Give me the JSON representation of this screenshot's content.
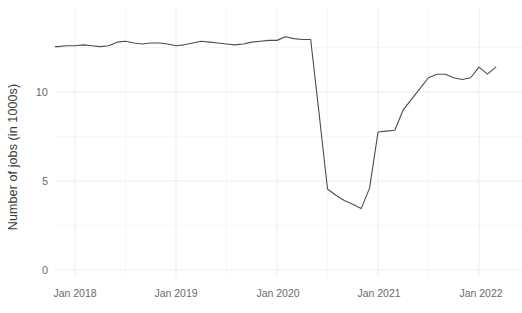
{
  "chart_data": {
    "type": "line",
    "title": "",
    "subtitle": "",
    "xlabel": "",
    "ylabel": "Number of jobs (in 1000s)",
    "ylim": [
      0,
      14
    ],
    "xlim": [
      "2017-09",
      "2022-05"
    ],
    "grid": true,
    "legend": null,
    "line_color": "#4d4d4d",
    "background": "#ffffff",
    "gridline_color": "#f4f4f4",
    "y_ticks": [
      "0",
      "5",
      "10"
    ],
    "y_tick_values": [
      0,
      5,
      10
    ],
    "x_ticks": [
      "Jan 2018",
      "Jan 2019",
      "Jan 2020",
      "Jan 2021",
      "Jan 2022"
    ],
    "x_tick_values": [
      "2018-01",
      "2019-01",
      "2020-01",
      "2021-01",
      "2022-01"
    ],
    "series": [
      {
        "name": "Number of jobs",
        "x": [
          "2017-10",
          "2017-11",
          "2017-12",
          "2018-01",
          "2018-02",
          "2018-03",
          "2018-04",
          "2018-05",
          "2018-06",
          "2018-07",
          "2018-08",
          "2018-09",
          "2018-10",
          "2018-11",
          "2018-12",
          "2019-01",
          "2019-02",
          "2019-03",
          "2019-04",
          "2019-05",
          "2019-06",
          "2019-07",
          "2019-08",
          "2019-09",
          "2019-10",
          "2019-11",
          "2019-12",
          "2020-01",
          "2020-02",
          "2020-03",
          "2020-04",
          "2020-05",
          "2020-06",
          "2020-07",
          "2020-08",
          "2020-09",
          "2020-10",
          "2020-11",
          "2020-12",
          "2021-01",
          "2021-02",
          "2021-03",
          "2021-04",
          "2021-05",
          "2021-06",
          "2021-07",
          "2021-08",
          "2021-09",
          "2021-10",
          "2021-11",
          "2021-12",
          "2022-01",
          "2022-02",
          "2022-03"
        ],
        "values": [
          12.55,
          12.55,
          12.6,
          12.6,
          12.65,
          12.6,
          12.55,
          12.6,
          12.8,
          12.85,
          12.75,
          12.7,
          12.75,
          12.75,
          12.7,
          12.6,
          12.65,
          12.75,
          12.85,
          12.8,
          12.75,
          12.7,
          12.65,
          12.7,
          12.8,
          12.85,
          12.9,
          12.9,
          13.1,
          13.0,
          12.95,
          12.95,
          8.8,
          4.55,
          4.2,
          3.9,
          3.7,
          3.45,
          4.6,
          7.75,
          7.8,
          7.85,
          9.0,
          9.6,
          10.2,
          10.8,
          11.0,
          11.0,
          10.8,
          10.7,
          10.8,
          11.4,
          11.0,
          11.4
        ]
      }
    ],
    "annotations": [
      {
        "label": "pre-pandemic plateau",
        "approx_value": 12.7
      },
      {
        "label": "pandemic trough",
        "approx_value": 3.45
      },
      {
        "label": "recovery end",
        "approx_value": 11.4
      }
    ]
  }
}
